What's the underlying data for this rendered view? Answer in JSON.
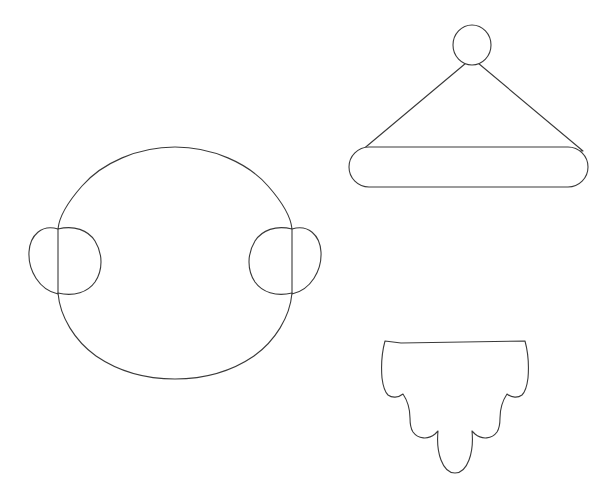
{
  "document": {
    "title": "Craft Template Sheet",
    "background_color": "#ffffff",
    "stroke_color": "#3a3a3a",
    "fill_color": "#ffffff",
    "stroke_width": 1.1,
    "width": 603,
    "height": 478
  },
  "shapes": [
    {
      "id": "face",
      "name": "Head / face outline with ears",
      "description": "Large rounded oval head outline with a semicircular ear bump on each side",
      "bounds": {
        "x": 33,
        "y": 147,
        "width": 284,
        "height": 231
      },
      "head_oval": {
        "cx": 175,
        "cy": 262,
        "rx": 118,
        "ry": 116
      },
      "ear_left": {
        "cx": 57,
        "cy": 259,
        "rx": 26,
        "ry": 30
      },
      "ear_right": {
        "cx": 294,
        "cy": 259,
        "rx": 26,
        "ry": 30
      },
      "path": "M 175 147 C 237 147 292 192 293 228 L 293 232 C 278 226 262 229 254 240 C 243 254 244 276 255 288 C 263 297 278 298 292 292 L 292 298 C 287 342 237 378 175 378 C 113 378 62 342 58 298 L 58 292 C 72 298 87 297 95 288 C 106 276 107 254 96 240 C 88 229 72 226 57 232 L 57 228 C 58 192 113 147 175 147 Z",
      "ear_left_path": "M 57 232 C 40 239 31 249 31 261 C 31 274 41 285 57 292",
      "ear_right_path": "M 292 232 C 309 239 318 249 318 261 C 318 274 308 285 292 292"
    },
    {
      "id": "hat",
      "name": "Santa hat (pom-pom, cone, brim)",
      "description": "Small circle pom-pom on top, triangular cone body, rounded-rectangle brim band",
      "bounds": {
        "x": 349,
        "y": 25,
        "width": 239,
        "height": 162
      },
      "pompom": {
        "cx": 472,
        "cy": 45,
        "rx": 19,
        "ry": 20
      },
      "cone": {
        "apex_x": 472,
        "apex_y": 64,
        "left_x": 362,
        "left_y": 150,
        "right_x": 582,
        "right_y": 150
      },
      "brim": {
        "x": 349,
        "y": 147,
        "width": 239,
        "height": 40,
        "radius": 20
      }
    },
    {
      "id": "beard",
      "name": "Scalloped beard",
      "description": "Flat top edge with rounded shoulders and three rounded scalloped lobes along the bottom",
      "bounds": {
        "x": 397,
        "y": 341,
        "width": 130,
        "height": 132
      },
      "top_edge": {
        "x1": 401,
        "y1": 342,
        "x2": 524,
        "y2": 341
      },
      "lobes": [
        {
          "cx": 420,
          "cy": 418,
          "r": 24
        },
        {
          "cx": 462,
          "cy": 443,
          "r": 30
        },
        {
          "cx": 504,
          "cy": 418,
          "r": 24
        }
      ],
      "path": "M 401 342 L 524 341 C 527 357 528 378 525 392 C 520 398 512 398 506 393 C 500 401 497 412 498 421 C 495 435 480 442 470 434 C 472 450 468 464 460 470 C 451 473 442 463 440 449 C 439 441 440 434 442 428 C 431 441 417 438 412 425 C 410 417 412 404 417 395 C 410 399 402 398 398 391 C 395 377 396 357 401 342 Z"
    }
  ],
  "colors": {
    "background": "#ffffff",
    "stroke": "#3a3a3a",
    "fill": "#ffffff"
  }
}
